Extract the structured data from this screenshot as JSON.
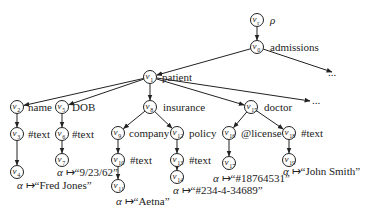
{
  "diagram": {
    "type": "xml-tree",
    "nodes": [
      {
        "id": "vr",
        "sub": "r",
        "x": 257,
        "y": 20,
        "label": "ρ",
        "lx": 270,
        "ly": 24
      },
      {
        "id": "v0",
        "sub": "0",
        "x": 257,
        "y": 47,
        "label": "admissions",
        "lx": 270,
        "ly": 51
      },
      {
        "id": "v1",
        "sub": "1",
        "x": 150,
        "y": 77,
        "label": "patient",
        "lx": 162,
        "ly": 81
      },
      {
        "id": "v2",
        "sub": "2",
        "x": 17,
        "y": 107,
        "label": "name",
        "lx": 28,
        "ly": 111
      },
      {
        "id": "v3",
        "sub": "3",
        "x": 17,
        "y": 134,
        "label": "#text",
        "lx": 28,
        "ly": 138
      },
      {
        "id": "v4",
        "sub": "4",
        "x": 17,
        "y": 172,
        "label": "",
        "lx": 0,
        "ly": 0
      },
      {
        "id": "v5",
        "sub": "5",
        "x": 62,
        "y": 107,
        "label": "DOB",
        "lx": 72,
        "ly": 111
      },
      {
        "id": "v6",
        "sub": "6",
        "x": 62,
        "y": 134,
        "label": "#text",
        "lx": 72,
        "ly": 138
      },
      {
        "id": "v7",
        "sub": "7",
        "x": 62,
        "y": 160,
        "label": "",
        "lx": 0,
        "ly": 0
      },
      {
        "id": "v8",
        "sub": "8",
        "x": 150,
        "y": 107,
        "label": "insurance",
        "lx": 163,
        "ly": 111
      },
      {
        "id": "v9",
        "sub": "9",
        "x": 118,
        "y": 133,
        "label": "company",
        "lx": 129,
        "ly": 137
      },
      {
        "id": "v10",
        "sub": "10",
        "x": 118,
        "y": 160,
        "label": "#text",
        "lx": 130,
        "ly": 164
      },
      {
        "id": "v11",
        "sub": "11",
        "x": 118,
        "y": 186,
        "label": "",
        "lx": 0,
        "ly": 0
      },
      {
        "id": "v12",
        "sub": "12",
        "x": 177,
        "y": 133,
        "label": "policy",
        "lx": 189,
        "ly": 137
      },
      {
        "id": "v13",
        "sub": "13",
        "x": 177,
        "y": 160,
        "label": "#text",
        "lx": 189,
        "ly": 164
      },
      {
        "id": "v14",
        "sub": "14",
        "x": 177,
        "y": 177,
        "label": "",
        "lx": 0,
        "ly": 0
      },
      {
        "id": "v15",
        "sub": "15",
        "x": 251,
        "y": 107,
        "label": "doctor",
        "lx": 264,
        "ly": 111
      },
      {
        "id": "v16",
        "sub": "16",
        "x": 229,
        "y": 133,
        "label": "@license",
        "lx": 241,
        "ly": 137
      },
      {
        "id": "v17",
        "sub": "17",
        "x": 229,
        "y": 163,
        "label": "",
        "lx": 0,
        "ly": 0
      },
      {
        "id": "v18",
        "sub": "18",
        "x": 289,
        "y": 133,
        "label": "#text",
        "lx": 301,
        "ly": 137
      },
      {
        "id": "v19",
        "sub": "19",
        "x": 289,
        "y": 160,
        "label": "",
        "lx": 0,
        "ly": 0
      }
    ],
    "edges": [
      [
        "vr",
        "v0"
      ],
      [
        "v0",
        "v1"
      ],
      [
        "v1",
        "v2"
      ],
      [
        "v1",
        "v5"
      ],
      [
        "v1",
        "v8"
      ],
      [
        "v1",
        "v15"
      ],
      [
        "v2",
        "v3"
      ],
      [
        "v3",
        "v4"
      ],
      [
        "v5",
        "v6"
      ],
      [
        "v6",
        "v7"
      ],
      [
        "v8",
        "v9"
      ],
      [
        "v8",
        "v12"
      ],
      [
        "v9",
        "v10"
      ],
      [
        "v10",
        "v11"
      ],
      [
        "v12",
        "v13"
      ],
      [
        "v13",
        "v14"
      ],
      [
        "v15",
        "v16"
      ],
      [
        "v15",
        "v18"
      ],
      [
        "v16",
        "v17"
      ],
      [
        "v18",
        "v19"
      ]
    ],
    "ellipsis_edges": [
      {
        "from": "v0",
        "x2": 332,
        "y2": 72,
        "dots_x": 328,
        "dots_y": 76
      },
      {
        "from": "v1",
        "x2": 310,
        "y2": 101,
        "dots_x": 312,
        "dots_y": 104
      }
    ],
    "values": [
      {
        "node": "v4",
        "text": "“Fred Jones”",
        "x": 17,
        "y": 189
      },
      {
        "node": "v7",
        "text": "“9/23/62”",
        "x": 57,
        "y": 176
      },
      {
        "node": "v11",
        "text": "“Aetna”",
        "x": 116,
        "y": 205
      },
      {
        "node": "v14",
        "text": "“#234-4-34689”",
        "x": 173,
        "y": 194
      },
      {
        "node": "v17",
        "text": "“#18764531”",
        "x": 213,
        "y": 182
      },
      {
        "node": "v19",
        "text": "“John Smith”",
        "x": 283,
        "y": 175
      }
    ],
    "alpha_symbol": "α",
    "mapsto_symbol": "↦",
    "ellipsis_text": "..."
  }
}
